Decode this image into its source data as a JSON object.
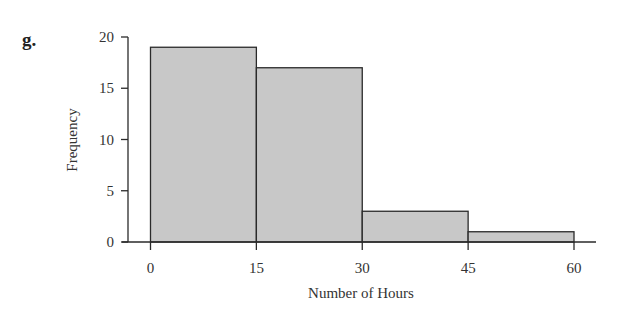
{
  "panel_label": "g.",
  "chart_data": {
    "type": "bar",
    "subtype": "histogram",
    "title": "",
    "xlabel": "Number of Hours",
    "ylabel": "Frequency",
    "bins": [
      {
        "start": 0,
        "end": 15,
        "frequency": 19
      },
      {
        "start": 15,
        "end": 30,
        "frequency": 17
      },
      {
        "start": 30,
        "end": 45,
        "frequency": 3
      },
      {
        "start": 45,
        "end": 60,
        "frequency": 1
      }
    ],
    "categories": [
      "0-15",
      "15-30",
      "30-45",
      "45-60"
    ],
    "values": [
      19,
      17,
      3,
      1
    ],
    "x_ticks": [
      "0",
      "15",
      "30",
      "45",
      "60"
    ],
    "y_ticks": [
      "0",
      "5",
      "10",
      "15",
      "20"
    ],
    "xlim": [
      0,
      60
    ],
    "ylim": [
      0,
      20
    ],
    "grid": false,
    "legend": null,
    "bar_color": "#c8c8c8",
    "edge_color": "#2a2a2a"
  }
}
